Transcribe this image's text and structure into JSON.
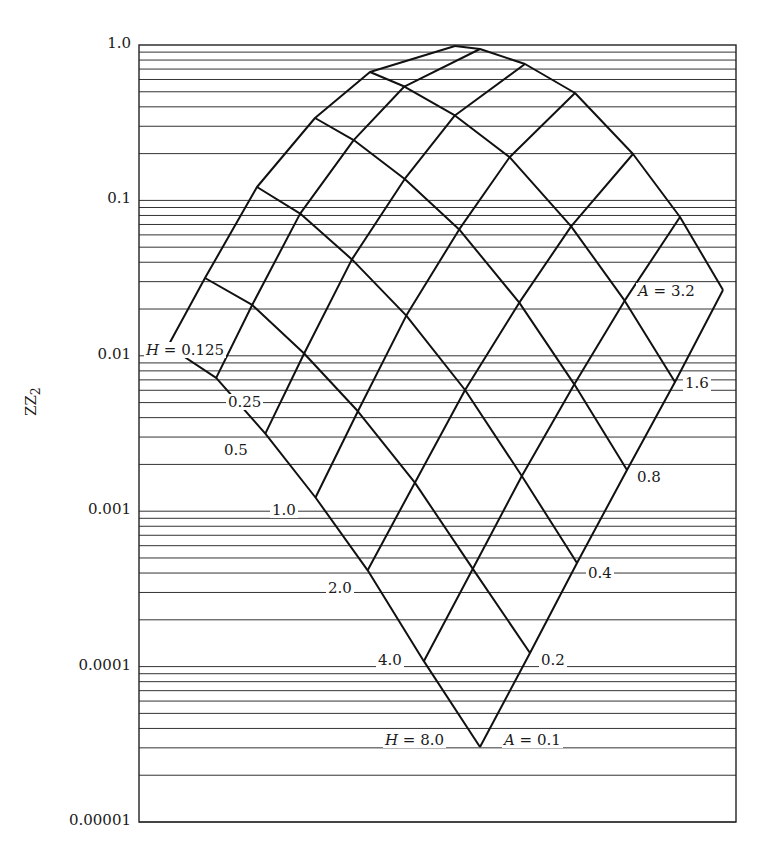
{
  "chart_data": {
    "type": "line",
    "title": "",
    "xlabel": "",
    "ylabel": "ZZ2",
    "yscale": "log",
    "ylim": [
      1e-05,
      1.0
    ],
    "y_ticks": [
      "1.0",
      "0.1",
      "0.01",
      "0.001",
      "0.0001",
      "0.00001"
    ],
    "grid": "horizontal log minor gridlines",
    "mesh": {
      "description": "Nomogram mesh of constant-H and constant-A curves",
      "H_values": [
        "0.125",
        "0.25",
        "0.5",
        "1.0",
        "2.0",
        "4.0",
        "8.0"
      ],
      "A_values": [
        "0.1",
        "0.2",
        "0.4",
        "0.8",
        "1.6",
        "3.2"
      ],
      "corner_ZZ2": {
        "H0.125_A0.1": 0.008,
        "H8.0_A0.1": 3e-05,
        "H8.0_A3.2": 0.025,
        "H0.125_A3.2": 0.97
      },
      "edge_A0.1_ZZ2_by_H": [
        0.008,
        0.005,
        0.0025,
        0.001,
        0.00035,
        0.0001,
        3e-05
      ],
      "edge_H8.0_ZZ2_by_A": [
        3e-05,
        0.0001,
        0.00035,
        0.001,
        0.0075,
        0.025
      ]
    }
  },
  "axis": {
    "ylabel": "ZZ",
    "ylabel_sub": "2",
    "ticks": [
      {
        "label": "1.0",
        "value": 1.0
      },
      {
        "label": "0.1",
        "value": 0.1
      },
      {
        "label": "0.01",
        "value": 0.01
      },
      {
        "label": "0.001",
        "value": 0.001
      },
      {
        "label": "0.0001",
        "value": 0.0001
      },
      {
        "label": "0.00001",
        "value": 1e-05
      }
    ]
  },
  "plot": {
    "left": 139,
    "right": 736,
    "top_y": 45,
    "decade_px": 155.4
  },
  "boundaries": {
    "left_A01": [
      [
        163,
        369
      ],
      [
        212,
        397
      ],
      [
        262,
        449
      ],
      [
        313,
        509
      ],
      [
        366,
        578
      ],
      [
        423,
        665
      ],
      [
        480,
        747
      ]
    ],
    "right_H8": [
      [
        480,
        747
      ],
      [
        530,
        653
      ],
      [
        577,
        563
      ],
      [
        627,
        470
      ],
      [
        675,
        382
      ],
      [
        723,
        290
      ]
    ],
    "top_H0125": [
      [
        168,
        346
      ],
      [
        205,
        278
      ],
      [
        257,
        187
      ],
      [
        315,
        118
      ],
      [
        370,
        72
      ],
      [
        455,
        46
      ]
    ],
    "top_A32": [
      [
        455,
        46
      ],
      [
        480,
        49
      ],
      [
        525,
        64
      ],
      [
        575,
        93
      ],
      [
        633,
        154
      ],
      [
        680,
        217
      ],
      [
        723,
        290
      ]
    ]
  },
  "labels": {
    "H_start": {
      "prefix": "H",
      "eq": " = ",
      "value": "0.125"
    },
    "H_values": [
      "0.25",
      "0.5",
      "1.0",
      "2.0",
      "4.0"
    ],
    "H_end": {
      "prefix": "H",
      "eq": " = ",
      "value": "8.0"
    },
    "A_start": {
      "prefix": "A",
      "eq": " = ",
      "value": "0.1"
    },
    "A_values": [
      "0.2",
      "0.4",
      "0.8",
      "1.6"
    ],
    "A_end": {
      "prefix": "A",
      "eq": " = ",
      "value": "3.2"
    }
  }
}
